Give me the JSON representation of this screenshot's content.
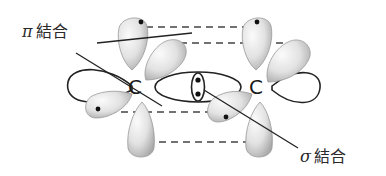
{
  "diagram": {
    "type": "orbital-overlap",
    "labels": {
      "pi_symbol": "π",
      "pi_text": "結合",
      "sigma_symbol": "σ",
      "sigma_text": "結合"
    },
    "atoms": [
      {
        "symbol": "C",
        "position": "left"
      },
      {
        "symbol": "C",
        "position": "right"
      }
    ],
    "colors": {
      "stroke": "#222222",
      "lobe_fill_light": "#f4f4f4",
      "lobe_fill_dark": "#b8b8b8",
      "dash": "#444444"
    }
  }
}
